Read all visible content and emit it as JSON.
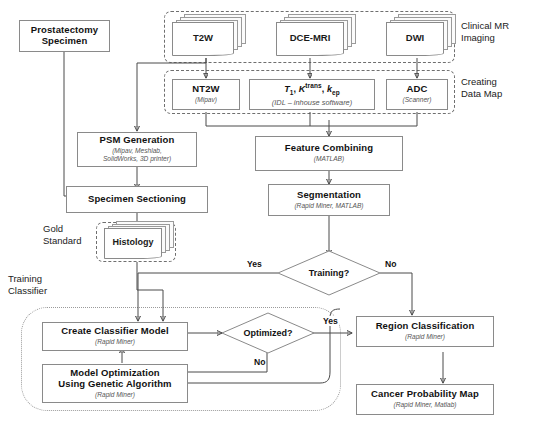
{
  "diagram": {
    "regions": [
      {
        "id": "clinical-mr",
        "label": "Clinical MR\nImaging"
      },
      {
        "id": "data-map",
        "label": "Creating\nData Map"
      },
      {
        "id": "gold-standard",
        "label": "Gold\nStandard"
      },
      {
        "id": "training-classifier",
        "label": "Training\nClassifier"
      }
    ],
    "nodes": {
      "prostatectomy": {
        "title": "Prostatectomy\nSpecimen",
        "sub": ""
      },
      "t2w": {
        "title": "T2W"
      },
      "dce": {
        "title": "DCE-MRI"
      },
      "dwi": {
        "title": "DWI"
      },
      "nt2w": {
        "title": "NT2W",
        "sub": "(Mipav)"
      },
      "params": {
        "title": "T1, Ktrans, kep",
        "sub": "(IDL – inhouse software)"
      },
      "adc": {
        "title": "ADC",
        "sub": "(Scanner)"
      },
      "psm": {
        "title": "PSM Generation",
        "sub": "(Mipav, Meshlab,\nSolidWorks, 3D printer)"
      },
      "sectioning": {
        "title": "Specimen Sectioning",
        "sub": ""
      },
      "histology": {
        "title": "Histology"
      },
      "feature": {
        "title": "Feature Combining",
        "sub": "(MATLAB)"
      },
      "segmentation": {
        "title": "Segmentation",
        "sub": "(Rapid Miner, MATLAB)"
      },
      "create-model": {
        "title": "Create Classifier Model",
        "sub": "(Rapid Miner)"
      },
      "optimization": {
        "title": "Model Optimization\nUsing Genetic Algorithm",
        "sub": "(Rapid Miner)"
      },
      "region-class": {
        "title": "Region Classification",
        "sub": "(Rapid Miner)"
      },
      "cancer-map": {
        "title": "Cancer Probability Map",
        "sub": "(Rapid Miner, Matlab)"
      }
    },
    "decisions": {
      "training": {
        "label": "Training?"
      },
      "optimized": {
        "label": "Optimized?"
      }
    },
    "edge_labels": {
      "training_yes": "Yes",
      "training_no": "No",
      "optimized_yes": "Yes",
      "optimized_no": "No"
    },
    "colors": {
      "box_border": "#8a8a8a",
      "connector": "#4a4a4a",
      "region_border": "#6f6f6f",
      "text": "#111111",
      "subtext": "#555555"
    }
  }
}
